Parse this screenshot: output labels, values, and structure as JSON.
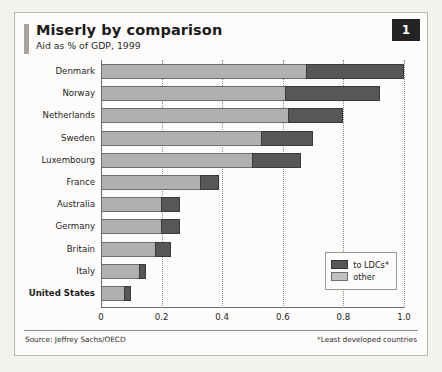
{
  "header": {
    "title": "Miserly by comparison",
    "subtitle": "Aid as % of GDP, 1999",
    "badge": "1"
  },
  "footer": {
    "source": "Source: Jeffrey Sachs/OECD",
    "footnote": "*Least developed countries"
  },
  "legend": {
    "items": [
      {
        "label": "to LDCs*",
        "color": "#575757",
        "key": "ldc"
      },
      {
        "label": "other",
        "color": "#c3c1bf",
        "key": "other"
      }
    ]
  },
  "chart_data": {
    "type": "bar",
    "orientation": "horizontal",
    "stacked": true,
    "title": "Miserly by comparison",
    "subtitle": "Aid as % of GDP, 1999",
    "xlabel": "",
    "ylabel": "",
    "xlim": [
      0,
      1.0
    ],
    "xticks": [
      0,
      0.2,
      0.4,
      0.6,
      0.8,
      1.0
    ],
    "xtick_labels": [
      "0",
      "0.2",
      "0.4",
      "0.6",
      "0.8",
      "1.0"
    ],
    "grid": "vertical-dotted",
    "legend_position": "bottom-right-inside",
    "categories": [
      "Denmark",
      "Norway",
      "Netherlands",
      "Sweden",
      "Luxembourg",
      "France",
      "Australia",
      "Germany",
      "Britain",
      "Italy",
      "United States"
    ],
    "emphasized_category": "United States",
    "series": [
      {
        "name": "other",
        "color": "#b2b0ae",
        "values": [
          0.68,
          0.61,
          0.62,
          0.53,
          0.5,
          0.33,
          0.2,
          0.2,
          0.18,
          0.13,
          0.08
        ]
      },
      {
        "name": "to LDCs*",
        "color": "#575757",
        "values": [
          0.32,
          0.31,
          0.18,
          0.17,
          0.16,
          0.06,
          0.06,
          0.06,
          0.05,
          0.02,
          0.02
        ]
      }
    ],
    "totals": [
      1.0,
      0.92,
      0.8,
      0.7,
      0.66,
      0.39,
      0.26,
      0.26,
      0.23,
      0.15,
      0.1
    ]
  }
}
